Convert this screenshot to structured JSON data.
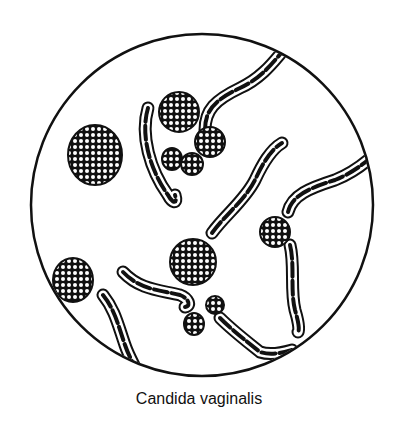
{
  "figure": {
    "caption": "Candida vaginalis",
    "field": {
      "cx": 202,
      "cy": 205,
      "r": 171
    },
    "colors": {
      "ink": "#111111",
      "paper": "#ffffff"
    },
    "cells": [
      {
        "cx": 95,
        "cy": 155,
        "rx": 27,
        "ry": 30
      },
      {
        "cx": 179,
        "cy": 112,
        "rx": 20,
        "ry": 20
      },
      {
        "cx": 210,
        "cy": 142,
        "rx": 15,
        "ry": 15
      },
      {
        "cx": 172,
        "cy": 159,
        "rx": 10,
        "ry": 11
      },
      {
        "cx": 192,
        "cy": 164,
        "rx": 11,
        "ry": 11
      },
      {
        "cx": 193,
        "cy": 262,
        "rx": 23,
        "ry": 23
      },
      {
        "cx": 275,
        "cy": 232,
        "rx": 15,
        "ry": 15
      },
      {
        "cx": 73,
        "cy": 280,
        "rx": 20,
        "ry": 22
      },
      {
        "cx": 215,
        "cy": 305,
        "rx": 9,
        "ry": 9
      },
      {
        "cx": 194,
        "cy": 324,
        "rx": 10,
        "ry": 11
      }
    ],
    "hyphae": [
      "M 148 108 C 140 135, 150 170, 168 195 C 172 203, 178 205, 175 195",
      "M 205 130 C 205 110, 215 100, 240 88 C 262 78, 275 60, 282 52",
      "M 212 233 C 225 215, 245 200, 255 180 C 262 165, 270 150, 282 143",
      "M 288 212 C 292 195, 310 188, 335 180 C 350 174, 362 165, 368 160",
      "M 290 245 C 295 265, 290 290, 295 310 C 298 320, 300 330, 298 332",
      "M 123 272 C 140 290, 160 290, 180 295 C 188 298, 192 306, 185 307",
      "M 220 318 C 232 330, 245 340, 260 352 C 272 356, 285 352, 292 350",
      "M 103 295 C 115 310, 118 325, 125 345 C 130 360, 138 370, 140 380"
    ]
  }
}
